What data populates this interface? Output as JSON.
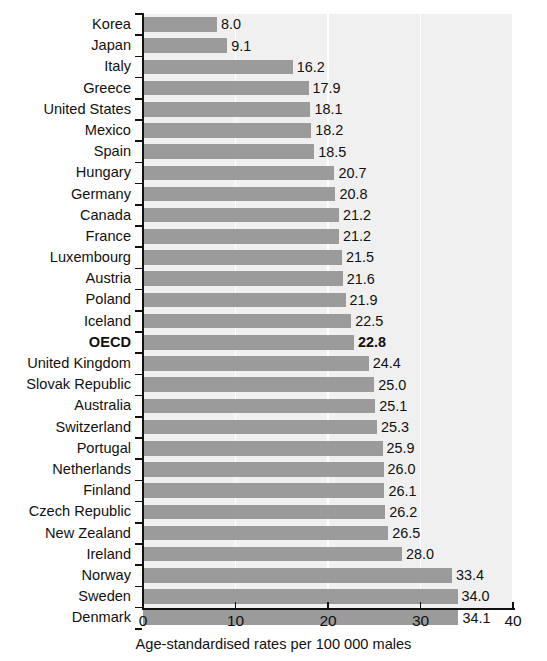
{
  "chart_data": {
    "type": "bar",
    "orientation": "horizontal",
    "title": "",
    "xlabel": "Age-standardised rates per 100 000 males",
    "ylabel": "",
    "xlim": [
      0,
      40
    ],
    "xticks": [
      0,
      10,
      20,
      30,
      40
    ],
    "xtick_labels": [
      "0",
      "10",
      "20",
      "30",
      "40"
    ],
    "grid": "vertical-white-on-light-gray",
    "legend": null,
    "bar_color": "#9b9b9b",
    "plot_background": "#f0f0f0",
    "gridline_color": "#ffffff",
    "axis_color": "#111111",
    "highlight_category": "OECD",
    "categories": [
      "Korea",
      "Japan",
      "Italy",
      "Greece",
      "United States",
      "Mexico",
      "Spain",
      "Hungary",
      "Germany",
      "Canada",
      "France",
      "Luxembourg",
      "Austria",
      "Poland",
      "Iceland",
      "OECD",
      "United Kingdom",
      "Slovak Republic",
      "Australia",
      "Switzerland",
      "Portugal",
      "Netherlands",
      "Finland",
      "Czech Republic",
      "New Zealand",
      "Ireland",
      "Norway",
      "Sweden",
      "Denmark"
    ],
    "values": [
      8.0,
      9.1,
      16.2,
      17.9,
      18.1,
      18.2,
      18.5,
      20.7,
      20.8,
      21.2,
      21.2,
      21.5,
      21.6,
      21.9,
      22.5,
      22.8,
      24.4,
      25.0,
      25.1,
      25.3,
      25.9,
      26.0,
      26.1,
      26.2,
      26.5,
      28.0,
      33.4,
      34.0,
      34.1
    ],
    "value_labels": [
      "8.0",
      "9.1",
      "16.2",
      "17.9",
      "18.1",
      "18.2",
      "18.5",
      "20.7",
      "20.8",
      "21.2",
      "21.2",
      "21.5",
      "21.6",
      "21.9",
      "22.5",
      "22.8",
      "24.4",
      "25.0",
      "25.1",
      "25.3",
      "25.9",
      "26.0",
      "26.1",
      "26.2",
      "26.5",
      "28.0",
      "33.4",
      "34.0",
      "34.1"
    ]
  }
}
